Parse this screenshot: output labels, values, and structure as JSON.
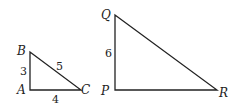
{
  "diagram": {
    "triangles": [
      {
        "name": "ABC",
        "vertices": {
          "A": "A",
          "B": "B",
          "C": "C"
        },
        "sides": {
          "AB": "3",
          "AC": "4",
          "BC": "5"
        }
      },
      {
        "name": "PQR",
        "vertices": {
          "P": "P",
          "Q": "Q",
          "R": "R"
        },
        "sides": {
          "PQ": "6"
        }
      }
    ]
  }
}
